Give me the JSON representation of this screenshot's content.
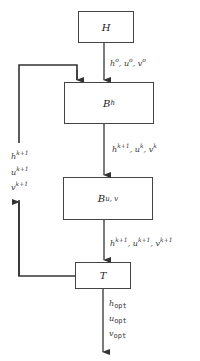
{
  "diagram": {
    "blocks": [
      {
        "id": "H",
        "label": "H",
        "sub": ""
      },
      {
        "id": "Bh",
        "label": "B",
        "sub": "h"
      },
      {
        "id": "Buv",
        "label": "B",
        "sub": "u, v"
      },
      {
        "id": "T",
        "label": "T",
        "sub": ""
      }
    ],
    "edges": {
      "H_to_Bh": {
        "vars": [
          "h",
          "u",
          "v"
        ],
        "sup": [
          "o",
          "o",
          "o"
        ]
      },
      "Bh_to_Buv": {
        "vars": [
          "h",
          "u",
          "v"
        ],
        "sup": [
          "k+1",
          "k",
          "k"
        ]
      },
      "Buv_to_T": {
        "vars": [
          "h",
          "u",
          "v"
        ],
        "sup": [
          "k+1",
          "k+1",
          "k+1"
        ]
      },
      "T_feedback_to_Bh": {
        "vars": [
          "h",
          "u",
          "v"
        ],
        "sup": [
          "k+1",
          "k+1",
          "k+1"
        ]
      },
      "T_output": {
        "vars": [
          "h",
          "u",
          "v"
        ],
        "sub": "opt"
      }
    },
    "line_color": "#333333"
  }
}
